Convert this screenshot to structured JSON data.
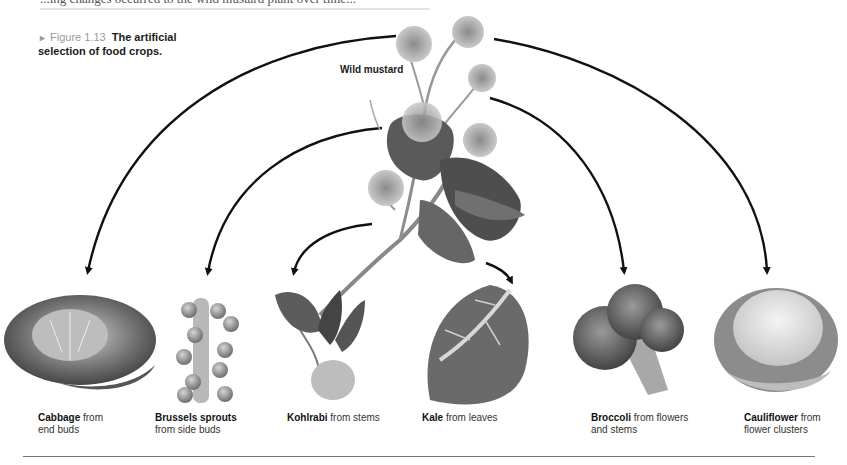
{
  "page": {
    "partial_top_text": "...ing changes occurred to the wild mustard plant over time..."
  },
  "figure": {
    "arrow_glyph": "►",
    "number": "Figure 1.13",
    "title_line1": "The artificial",
    "title_line2": "selection of food crops."
  },
  "source_plant": {
    "name": "Wild mustard"
  },
  "crops": [
    {
      "name": "Cabbage",
      "line1_rest": " from",
      "line2": "end buds"
    },
    {
      "name": "Brussels sprouts",
      "line1_rest": "",
      "line2": "from side buds"
    },
    {
      "name": "Kohlrabi",
      "line1_rest": " from stems",
      "line2": ""
    },
    {
      "name": "Kale",
      "line1_rest": " from leaves",
      "line2": ""
    },
    {
      "name": "Broccoli",
      "line1_rest": " from flowers",
      "line2": "and stems"
    },
    {
      "name": "Cauliflower",
      "line1_rest": " from",
      "line2": "flower clusters"
    }
  ],
  "colors": {
    "figure_number": "#9a9a9a",
    "arrows": "#111111",
    "divider": "#777777"
  }
}
